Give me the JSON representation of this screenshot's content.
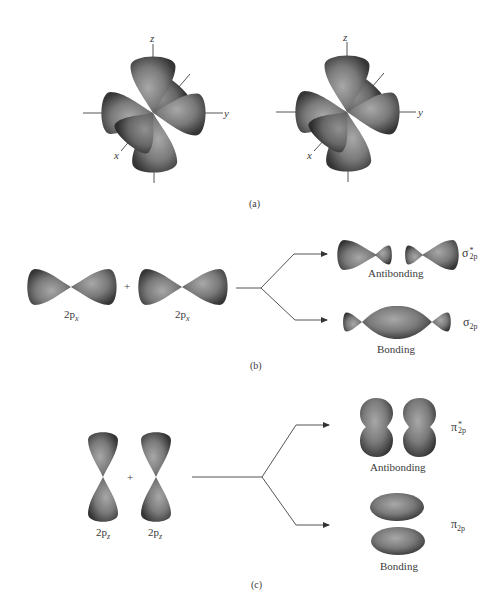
{
  "figure": {
    "panels": [
      {
        "id": "a",
        "label": "(a)",
        "description": "Two sets of three 2p orbitals (px, py, pz) on coordinate axes",
        "axes_labels": {
          "z": "z",
          "y": "y",
          "x": "x"
        }
      },
      {
        "id": "b",
        "label": "(b)",
        "description": "Two 2px orbitals combining end-on to form sigma molecular orbitals",
        "inputs": [
          {
            "label_main": "2p",
            "label_sub": "x"
          },
          {
            "label_main": "2p",
            "label_sub": "x"
          }
        ],
        "plus": "+",
        "outputs": [
          {
            "name": "Antibonding",
            "symbol": "σ",
            "superscript": "*",
            "subscript": "2p"
          },
          {
            "name": "Bonding",
            "symbol": "σ",
            "superscript": "",
            "subscript": "2p"
          }
        ]
      },
      {
        "id": "c",
        "label": "(c)",
        "description": "Two 2pz orbitals combining side-on to form pi molecular orbitals",
        "inputs": [
          {
            "label_main": "2p",
            "label_sub": "z"
          },
          {
            "label_main": "2p",
            "label_sub": "z"
          }
        ],
        "plus": "+",
        "outputs": [
          {
            "name": "Antibonding",
            "symbol": "π",
            "superscript": "*",
            "subscript": "2p"
          },
          {
            "name": "Bonding",
            "symbol": "π",
            "superscript": "",
            "subscript": "2p"
          }
        ]
      }
    ],
    "colors": {
      "orbital_dark": "#3c3c3c",
      "orbital_light": "#9a9a9a",
      "line": "#555555",
      "text": "#3a3a3a"
    }
  }
}
